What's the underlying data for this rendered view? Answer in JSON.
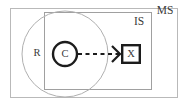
{
  "figure": {
    "type": "nested-boundary-diagram",
    "background_color": "#ffffff",
    "boundaries": [
      {
        "id": "ms",
        "label": "MS",
        "shape": "rectangle",
        "stroke_color": "#b9b9b9",
        "stroke_width": 1,
        "x": 10,
        "y": 8,
        "width": 168,
        "height": 90,
        "label_x": 165,
        "label_y": 10
      },
      {
        "id": "is",
        "label": "IS",
        "shape": "rectangle",
        "stroke_color": "#a0a0a0",
        "stroke_width": 1,
        "x": 44,
        "y": 12,
        "width": 108,
        "height": 78,
        "label_x": 139,
        "label_y": 22
      },
      {
        "id": "r",
        "label": "R",
        "shape": "circle",
        "stroke_color": "#b0b0b0",
        "stroke_width": 1,
        "cx": 65,
        "cy": 54,
        "r": 43,
        "label_x": 37,
        "label_y": 53
      }
    ],
    "nodes": [
      {
        "id": "c",
        "label": "C",
        "shape": "circle",
        "stroke_color": "#1c1c1c",
        "stroke_width": 2.4,
        "fill": "#ffffff",
        "cx": 65,
        "cy": 54,
        "r": 12,
        "label_x": 65,
        "label_y": 54
      },
      {
        "id": "x",
        "label": "X",
        "shape": "rectangle",
        "stroke_color": "#1c1c1c",
        "stroke_width": 2.4,
        "fill": "#ffffff",
        "x": 121,
        "y": 44,
        "width": 20,
        "height": 20,
        "label_x": 131,
        "label_y": 54
      }
    ],
    "edges": [
      {
        "id": "c-to-x",
        "from": "c",
        "to": "x",
        "style": "dashed",
        "arrowhead": "open-v",
        "stroke_color": "#1c1c1c",
        "stroke_width": 2,
        "dash_pattern": "4 3.5",
        "x1": 78,
        "y1": 54,
        "x2": 120,
        "y2": 54
      }
    ]
  }
}
